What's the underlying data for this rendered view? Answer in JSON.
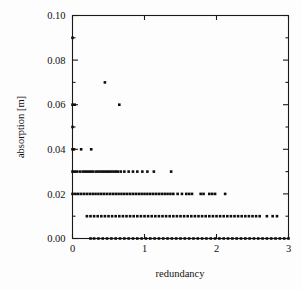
{
  "chart_data": {
    "type": "scatter",
    "title": "",
    "xlabel": "redundancy",
    "ylabel": "absorption [m]",
    "xlim": [
      0,
      3
    ],
    "ylim": [
      0.0,
      0.1
    ],
    "xticks": [
      0,
      1,
      2,
      3
    ],
    "xticklabels": [
      "0",
      "1",
      "2",
      "3"
    ],
    "yticks": [
      0.0,
      0.02,
      0.04,
      0.06,
      0.08,
      0.1
    ],
    "yticklabels": [
      "0.00",
      "0.02",
      "0.04",
      "0.06",
      "0.08",
      "0.10"
    ],
    "yminorticks": [
      0.01,
      0.03,
      0.05,
      0.07,
      0.09
    ],
    "grid": false,
    "legend": null,
    "marker": "square",
    "marker_size": 2.6,
    "marker_color": "#0d0d0d",
    "frame": "box",
    "tick_direction": "in",
    "points": [
      {
        "x": 0.0,
        "y": 0.09
      },
      {
        "x": 0.0,
        "y": 0.06
      },
      {
        "x": 0.03,
        "y": 0.06
      },
      {
        "x": 0.0,
        "y": 0.05
      },
      {
        "x": 0.0,
        "y": 0.04
      },
      {
        "x": 0.02,
        "y": 0.04
      },
      {
        "x": 0.12,
        "y": 0.04
      },
      {
        "x": 0.26,
        "y": 0.04
      },
      {
        "x": 0.45,
        "y": 0.07
      },
      {
        "x": 0.65,
        "y": 0.06
      },
      {
        "x": 0.0,
        "y": 0.03
      },
      {
        "x": 0.03,
        "y": 0.03
      },
      {
        "x": 0.06,
        "y": 0.03
      },
      {
        "x": 0.1,
        "y": 0.03
      },
      {
        "x": 0.14,
        "y": 0.03
      },
      {
        "x": 0.17,
        "y": 0.03
      },
      {
        "x": 0.2,
        "y": 0.03
      },
      {
        "x": 0.23,
        "y": 0.03
      },
      {
        "x": 0.26,
        "y": 0.03
      },
      {
        "x": 0.29,
        "y": 0.03
      },
      {
        "x": 0.33,
        "y": 0.03
      },
      {
        "x": 0.36,
        "y": 0.03
      },
      {
        "x": 0.39,
        "y": 0.03
      },
      {
        "x": 0.42,
        "y": 0.03
      },
      {
        "x": 0.45,
        "y": 0.03
      },
      {
        "x": 0.48,
        "y": 0.03
      },
      {
        "x": 0.51,
        "y": 0.03
      },
      {
        "x": 0.54,
        "y": 0.03
      },
      {
        "x": 0.57,
        "y": 0.03
      },
      {
        "x": 0.6,
        "y": 0.03
      },
      {
        "x": 0.63,
        "y": 0.03
      },
      {
        "x": 0.67,
        "y": 0.03
      },
      {
        "x": 0.72,
        "y": 0.03
      },
      {
        "x": 0.78,
        "y": 0.03
      },
      {
        "x": 0.84,
        "y": 0.03
      },
      {
        "x": 0.9,
        "y": 0.03
      },
      {
        "x": 0.97,
        "y": 0.03
      },
      {
        "x": 1.04,
        "y": 0.03
      },
      {
        "x": 1.13,
        "y": 0.03
      },
      {
        "x": 1.37,
        "y": 0.03
      },
      {
        "x": 0.0,
        "y": 0.02
      },
      {
        "x": 0.04,
        "y": 0.02
      },
      {
        "x": 0.08,
        "y": 0.02
      },
      {
        "x": 0.12,
        "y": 0.02
      },
      {
        "x": 0.16,
        "y": 0.02
      },
      {
        "x": 0.2,
        "y": 0.02
      },
      {
        "x": 0.24,
        "y": 0.02
      },
      {
        "x": 0.28,
        "y": 0.02
      },
      {
        "x": 0.32,
        "y": 0.02
      },
      {
        "x": 0.36,
        "y": 0.02
      },
      {
        "x": 0.4,
        "y": 0.02
      },
      {
        "x": 0.44,
        "y": 0.02
      },
      {
        "x": 0.48,
        "y": 0.02
      },
      {
        "x": 0.52,
        "y": 0.02
      },
      {
        "x": 0.56,
        "y": 0.02
      },
      {
        "x": 0.6,
        "y": 0.02
      },
      {
        "x": 0.64,
        "y": 0.02
      },
      {
        "x": 0.68,
        "y": 0.02
      },
      {
        "x": 0.72,
        "y": 0.02
      },
      {
        "x": 0.76,
        "y": 0.02
      },
      {
        "x": 0.8,
        "y": 0.02
      },
      {
        "x": 0.84,
        "y": 0.02
      },
      {
        "x": 0.88,
        "y": 0.02
      },
      {
        "x": 0.92,
        "y": 0.02
      },
      {
        "x": 0.96,
        "y": 0.02
      },
      {
        "x": 1.0,
        "y": 0.02
      },
      {
        "x": 1.04,
        "y": 0.02
      },
      {
        "x": 1.08,
        "y": 0.02
      },
      {
        "x": 1.12,
        "y": 0.02
      },
      {
        "x": 1.16,
        "y": 0.02
      },
      {
        "x": 1.2,
        "y": 0.02
      },
      {
        "x": 1.24,
        "y": 0.02
      },
      {
        "x": 1.28,
        "y": 0.02
      },
      {
        "x": 1.32,
        "y": 0.02
      },
      {
        "x": 1.36,
        "y": 0.02
      },
      {
        "x": 1.4,
        "y": 0.02
      },
      {
        "x": 1.46,
        "y": 0.02
      },
      {
        "x": 1.52,
        "y": 0.02
      },
      {
        "x": 1.58,
        "y": 0.02
      },
      {
        "x": 1.62,
        "y": 0.02
      },
      {
        "x": 1.66,
        "y": 0.02
      },
      {
        "x": 1.78,
        "y": 0.02
      },
      {
        "x": 1.82,
        "y": 0.02
      },
      {
        "x": 1.9,
        "y": 0.02
      },
      {
        "x": 1.94,
        "y": 0.02
      },
      {
        "x": 1.98,
        "y": 0.02
      },
      {
        "x": 2.12,
        "y": 0.02
      },
      {
        "x": 0.2,
        "y": 0.01
      },
      {
        "x": 0.25,
        "y": 0.01
      },
      {
        "x": 0.3,
        "y": 0.01
      },
      {
        "x": 0.35,
        "y": 0.01
      },
      {
        "x": 0.4,
        "y": 0.01
      },
      {
        "x": 0.45,
        "y": 0.01
      },
      {
        "x": 0.5,
        "y": 0.01
      },
      {
        "x": 0.55,
        "y": 0.01
      },
      {
        "x": 0.6,
        "y": 0.01
      },
      {
        "x": 0.65,
        "y": 0.01
      },
      {
        "x": 0.7,
        "y": 0.01
      },
      {
        "x": 0.75,
        "y": 0.01
      },
      {
        "x": 0.8,
        "y": 0.01
      },
      {
        "x": 0.85,
        "y": 0.01
      },
      {
        "x": 0.9,
        "y": 0.01
      },
      {
        "x": 0.95,
        "y": 0.01
      },
      {
        "x": 1.0,
        "y": 0.01
      },
      {
        "x": 1.05,
        "y": 0.01
      },
      {
        "x": 1.1,
        "y": 0.01
      },
      {
        "x": 1.15,
        "y": 0.01
      },
      {
        "x": 1.2,
        "y": 0.01
      },
      {
        "x": 1.25,
        "y": 0.01
      },
      {
        "x": 1.3,
        "y": 0.01
      },
      {
        "x": 1.35,
        "y": 0.01
      },
      {
        "x": 1.4,
        "y": 0.01
      },
      {
        "x": 1.45,
        "y": 0.01
      },
      {
        "x": 1.5,
        "y": 0.01
      },
      {
        "x": 1.55,
        "y": 0.01
      },
      {
        "x": 1.6,
        "y": 0.01
      },
      {
        "x": 1.65,
        "y": 0.01
      },
      {
        "x": 1.7,
        "y": 0.01
      },
      {
        "x": 1.75,
        "y": 0.01
      },
      {
        "x": 1.8,
        "y": 0.01
      },
      {
        "x": 1.85,
        "y": 0.01
      },
      {
        "x": 1.9,
        "y": 0.01
      },
      {
        "x": 1.95,
        "y": 0.01
      },
      {
        "x": 2.0,
        "y": 0.01
      },
      {
        "x": 2.05,
        "y": 0.01
      },
      {
        "x": 2.1,
        "y": 0.01
      },
      {
        "x": 2.15,
        "y": 0.01
      },
      {
        "x": 2.2,
        "y": 0.01
      },
      {
        "x": 2.25,
        "y": 0.01
      },
      {
        "x": 2.3,
        "y": 0.01
      },
      {
        "x": 2.35,
        "y": 0.01
      },
      {
        "x": 2.4,
        "y": 0.01
      },
      {
        "x": 2.45,
        "y": 0.01
      },
      {
        "x": 2.5,
        "y": 0.01
      },
      {
        "x": 2.55,
        "y": 0.01
      },
      {
        "x": 2.6,
        "y": 0.01
      },
      {
        "x": 2.7,
        "y": 0.01
      },
      {
        "x": 2.78,
        "y": 0.01
      },
      {
        "x": 2.84,
        "y": 0.01
      },
      {
        "x": 0.25,
        "y": 0.0
      },
      {
        "x": 0.3,
        "y": 0.0
      },
      {
        "x": 0.36,
        "y": 0.0
      },
      {
        "x": 0.42,
        "y": 0.0
      },
      {
        "x": 0.48,
        "y": 0.0
      },
      {
        "x": 0.54,
        "y": 0.0
      },
      {
        "x": 0.6,
        "y": 0.0
      },
      {
        "x": 0.66,
        "y": 0.0
      },
      {
        "x": 0.72,
        "y": 0.0
      },
      {
        "x": 0.78,
        "y": 0.0
      },
      {
        "x": 0.84,
        "y": 0.0
      },
      {
        "x": 0.9,
        "y": 0.0
      },
      {
        "x": 0.96,
        "y": 0.0
      },
      {
        "x": 1.02,
        "y": 0.0
      },
      {
        "x": 1.08,
        "y": 0.0
      },
      {
        "x": 1.14,
        "y": 0.0
      },
      {
        "x": 1.2,
        "y": 0.0
      },
      {
        "x": 1.26,
        "y": 0.0
      },
      {
        "x": 1.32,
        "y": 0.0
      },
      {
        "x": 1.38,
        "y": 0.0
      },
      {
        "x": 1.44,
        "y": 0.0
      },
      {
        "x": 1.5,
        "y": 0.0
      },
      {
        "x": 1.56,
        "y": 0.0
      },
      {
        "x": 1.62,
        "y": 0.0
      },
      {
        "x": 1.68,
        "y": 0.0
      },
      {
        "x": 1.74,
        "y": 0.0
      },
      {
        "x": 1.8,
        "y": 0.0
      },
      {
        "x": 1.86,
        "y": 0.0
      },
      {
        "x": 1.92,
        "y": 0.0
      },
      {
        "x": 1.98,
        "y": 0.0
      },
      {
        "x": 2.04,
        "y": 0.0
      },
      {
        "x": 2.1,
        "y": 0.0
      },
      {
        "x": 2.16,
        "y": 0.0
      },
      {
        "x": 2.22,
        "y": 0.0
      },
      {
        "x": 2.28,
        "y": 0.0
      },
      {
        "x": 2.34,
        "y": 0.0
      },
      {
        "x": 2.4,
        "y": 0.0
      },
      {
        "x": 2.46,
        "y": 0.0
      },
      {
        "x": 2.52,
        "y": 0.0
      },
      {
        "x": 2.58,
        "y": 0.0
      },
      {
        "x": 2.64,
        "y": 0.0
      },
      {
        "x": 2.7,
        "y": 0.0
      },
      {
        "x": 2.76,
        "y": 0.0
      },
      {
        "x": 2.82,
        "y": 0.0
      },
      {
        "x": 2.88,
        "y": 0.0
      },
      {
        "x": 2.94,
        "y": 0.0
      },
      {
        "x": 3.0,
        "y": 0.0
      }
    ]
  }
}
